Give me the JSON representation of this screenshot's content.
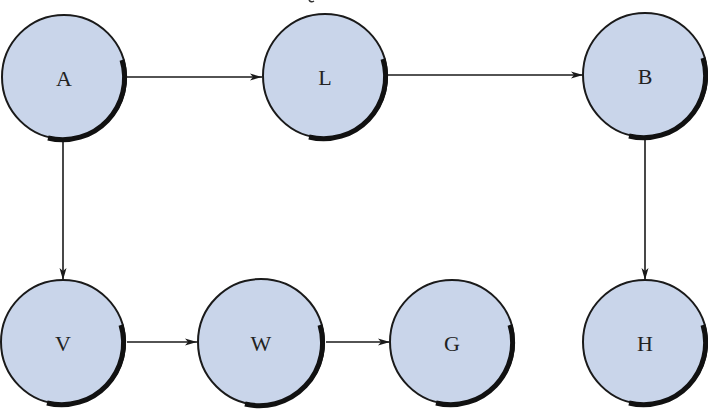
{
  "diagram": {
    "type": "directed-graph",
    "node_fill": "#c9d5ea",
    "stroke_color": "#1a1a1a",
    "nodes": [
      {
        "id": "A",
        "label": "A",
        "cx": 64,
        "cy": 77
      },
      {
        "id": "L",
        "label": "L",
        "cx": 325,
        "cy": 76
      },
      {
        "id": "B",
        "label": "B",
        "cx": 645,
        "cy": 75
      },
      {
        "id": "V",
        "label": "V",
        "cx": 63,
        "cy": 342
      },
      {
        "id": "W",
        "label": "W",
        "cx": 261,
        "cy": 342
      },
      {
        "id": "G",
        "label": "G",
        "cx": 452,
        "cy": 342
      },
      {
        "id": "H",
        "label": "H",
        "cx": 645,
        "cy": 342
      }
    ],
    "edges": [
      {
        "from": "A",
        "to": "L"
      },
      {
        "from": "L",
        "to": "B"
      },
      {
        "from": "A",
        "to": "V"
      },
      {
        "from": "B",
        "to": "H"
      },
      {
        "from": "V",
        "to": "W"
      },
      {
        "from": "W",
        "to": "G"
      }
    ]
  }
}
